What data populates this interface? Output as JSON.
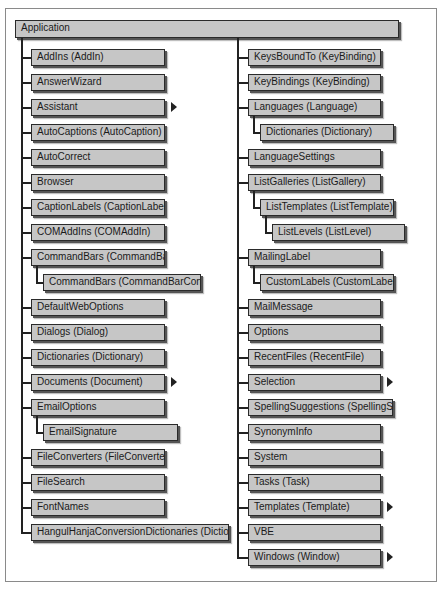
{
  "diagram": {
    "root": "Application",
    "left_column": [
      {
        "label": "AddIns (AddIn)",
        "level": 1,
        "arrow": false
      },
      {
        "label": "AnswerWizard",
        "level": 1,
        "arrow": false
      },
      {
        "label": "Assistant",
        "level": 1,
        "arrow": true
      },
      {
        "label": "AutoCaptions (AutoCaption)",
        "level": 1,
        "arrow": false
      },
      {
        "label": "AutoCorrect",
        "level": 1,
        "arrow": false
      },
      {
        "label": "Browser",
        "level": 1,
        "arrow": false
      },
      {
        "label": "CaptionLabels (CaptionLabel)",
        "level": 1,
        "arrow": false
      },
      {
        "label": "COMAddIns (COMAddIn)",
        "level": 1,
        "arrow": false
      },
      {
        "label": "CommandBars (CommandBar)",
        "level": 1,
        "arrow": false
      },
      {
        "label": "CommandBars (CommandBarControl)",
        "level": 2,
        "arrow": false
      },
      {
        "label": "DefaultWebOptions",
        "level": 1,
        "arrow": false
      },
      {
        "label": "Dialogs (Dialog)",
        "level": 1,
        "arrow": false
      },
      {
        "label": "Dictionaries (Dictionary)",
        "level": 1,
        "arrow": false
      },
      {
        "label": "Documents (Document)",
        "level": 1,
        "arrow": true
      },
      {
        "label": "EmailOptions",
        "level": 1,
        "arrow": false
      },
      {
        "label": "EmailSignature",
        "level": 2,
        "arrow": false
      },
      {
        "label": "FileConverters (FileConverter)",
        "level": 1,
        "arrow": false
      },
      {
        "label": "FileSearch",
        "level": 1,
        "arrow": false
      },
      {
        "label": "FontNames",
        "level": 1,
        "arrow": false
      },
      {
        "label": "HangulHanjaConversionDictionaries (Dictionary)",
        "level": 1,
        "arrow": false
      }
    ],
    "right_column": [
      {
        "label": "KeysBoundTo (KeyBinding)",
        "level": 1,
        "arrow": false
      },
      {
        "label": "KeyBindings (KeyBinding)",
        "level": 1,
        "arrow": false
      },
      {
        "label": "Languages (Language)",
        "level": 1,
        "arrow": false
      },
      {
        "label": "Dictionaries (Dictionary)",
        "level": 2,
        "arrow": false
      },
      {
        "label": "LanguageSettings",
        "level": 1,
        "arrow": false
      },
      {
        "label": "ListGalleries (ListGallery)",
        "level": 1,
        "arrow": false
      },
      {
        "label": "ListTemplates (ListTemplate)",
        "level": 2,
        "arrow": false
      },
      {
        "label": "ListLevels (ListLevel)",
        "level": 3,
        "arrow": false
      },
      {
        "label": "MailingLabel",
        "level": 1,
        "arrow": false
      },
      {
        "label": "CustomLabels (CustomLabel)",
        "level": 2,
        "arrow": false
      },
      {
        "label": "MailMessage",
        "level": 1,
        "arrow": false
      },
      {
        "label": "Options",
        "level": 1,
        "arrow": false
      },
      {
        "label": "RecentFiles (RecentFile)",
        "level": 1,
        "arrow": false
      },
      {
        "label": "Selection",
        "level": 1,
        "arrow": true
      },
      {
        "label": "SpellingSuggestions (SpellingSuggestion)",
        "level": 1,
        "arrow": false
      },
      {
        "label": "SynonymInfo",
        "level": 1,
        "arrow": false
      },
      {
        "label": "System",
        "level": 1,
        "arrow": false
      },
      {
        "label": "Tasks (Task)",
        "level": 1,
        "arrow": false
      },
      {
        "label": "Templates (Template)",
        "level": 1,
        "arrow": true
      },
      {
        "label": "VBE",
        "level": 1,
        "arrow": false
      },
      {
        "label": "Windows (Window)",
        "level": 1,
        "arrow": true
      }
    ]
  },
  "colors": {
    "box_fill": "#c6c6c6",
    "box_border": "#2a2a2a",
    "line": "#222222",
    "frame": "#8a8a8a"
  }
}
